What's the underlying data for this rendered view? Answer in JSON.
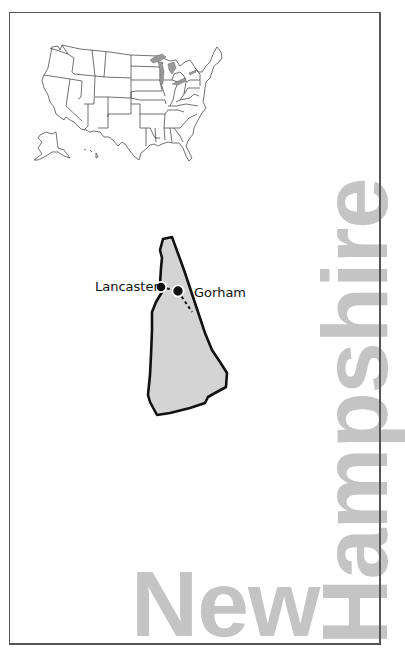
{
  "title": {
    "line1": "New",
    "line2": "Hampshire"
  },
  "inset_map": {
    "name": "United States",
    "highlight_color": "#9a9a9a"
  },
  "state_map": {
    "name": "New Hampshire",
    "fill_color": "#d4d4d4",
    "outline_color": "#111111"
  },
  "places": [
    {
      "name": "Lancaster",
      "marker": "filled-dot"
    },
    {
      "name": "Gorham",
      "marker": "filled-dot"
    }
  ],
  "colors": {
    "title_text": "#c4c4c4",
    "frame": "#555555"
  }
}
